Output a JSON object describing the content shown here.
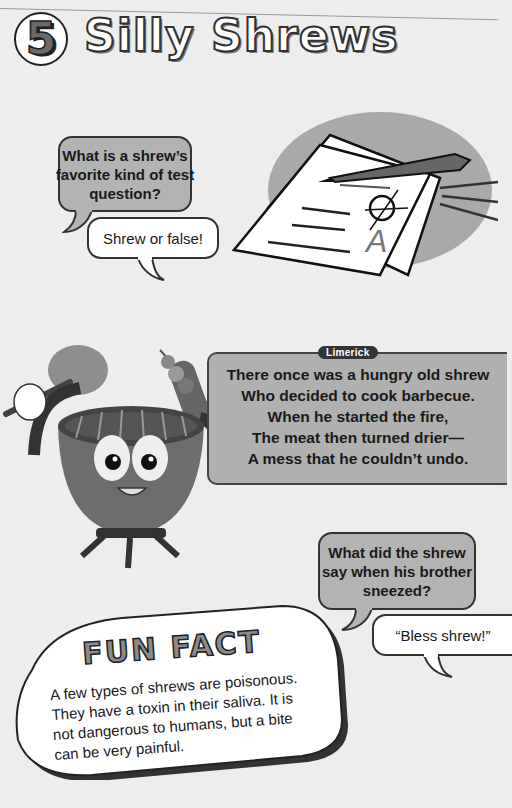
{
  "header": {
    "section_number": "5",
    "title": "Silly Shrews"
  },
  "joke1": {
    "question": "What is a shrew's favorite kind of test question?",
    "question_lines": [
      "What is a shrew’s",
      "favorite kind of test",
      "question?"
    ],
    "answer": "Shrew or false!"
  },
  "illustrations": {
    "test_paper": {
      "icon": "test-paper-pen-icon",
      "grade": "A"
    },
    "grill": {
      "icon": "barbecue-grill-mascot-icon"
    }
  },
  "limerick": {
    "tag": "Limerick",
    "lines": [
      "There once was a hungry old shrew",
      "Who decided to cook barbecue.",
      "When he started the fire,",
      "The meat then turned drier—",
      "A mess that he couldn’t undo."
    ]
  },
  "joke2": {
    "question_lines": [
      "What did the shrew",
      "say when his brother",
      "sneezed?"
    ],
    "answer": "“Bless shrew!”"
  },
  "fun_fact": {
    "title": "FUN FACT",
    "lines": [
      "A few types of shrews are poisonous.",
      "They have a toxin in their saliva. It is",
      "not dangerous to humans, but a bite",
      "can be very painful."
    ]
  },
  "colors": {
    "page_bg": "#ededed",
    "bubble_question": "#b3b3b3",
    "bubble_answer": "#ffffff",
    "outline": "#333333"
  }
}
